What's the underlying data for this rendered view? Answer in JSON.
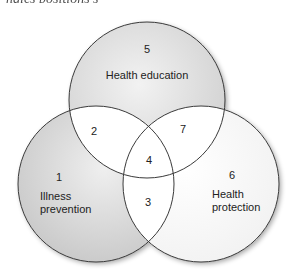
{
  "caption": {
    "text": "ngles positions s"
  },
  "diagram": {
    "type": "venn-3",
    "colors": {
      "outline": "#3a3a3a",
      "shade_dark": "#c8c8c8",
      "shade_light": "#efefef",
      "intersection": "#ffffff"
    },
    "circles": [
      {
        "id": "top",
        "number": "5",
        "label_lines": [
          "Health education"
        ]
      },
      {
        "id": "left",
        "number": "1",
        "label_lines": [
          "Illness",
          "prevention"
        ]
      },
      {
        "id": "right",
        "number": "6",
        "label_lines": [
          "Health",
          "protection"
        ]
      }
    ],
    "intersections": [
      {
        "id": "top-left",
        "number": "2"
      },
      {
        "id": "top-right",
        "number": "7"
      },
      {
        "id": "left-right",
        "number": "3"
      },
      {
        "id": "center",
        "number": "4"
      }
    ]
  }
}
